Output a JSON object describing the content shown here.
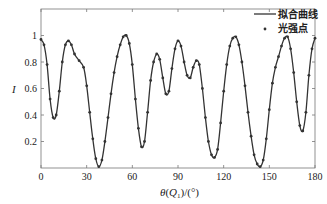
{
  "chart_data": {
    "type": "line",
    "title": "",
    "xlabel": "θ(Q1)/(°)",
    "ylabel": "I",
    "xlim": [
      0,
      180
    ],
    "ylim": [
      0,
      1.2
    ],
    "xticks": [
      0,
      30,
      60,
      90,
      120,
      150,
      180
    ],
    "yticks": [
      0.2,
      0.4,
      0.6,
      0.8,
      1
    ],
    "ytick_labels": [
      "0.2",
      "0.4",
      "0.6",
      "0.8",
      "1"
    ],
    "grid": false,
    "legend_position": "upper right",
    "series": [
      {
        "name": "拟合曲线",
        "style": "solid line",
        "color": "#333333",
        "x": [
          0,
          2,
          4,
          6,
          8,
          10,
          12,
          14,
          16,
          18,
          20,
          22,
          25,
          28,
          30,
          32,
          34,
          36,
          38,
          40,
          42,
          44,
          46,
          48,
          50,
          52,
          54,
          56,
          58,
          60,
          62,
          64,
          66,
          68,
          70,
          72,
          74,
          76,
          78,
          80,
          82,
          84,
          86,
          88,
          90,
          92,
          94,
          96,
          98,
          100,
          102,
          104,
          106,
          108,
          110,
          112,
          114,
          116,
          118,
          120,
          122,
          124,
          126,
          128,
          130,
          132,
          134,
          136,
          138,
          140,
          142,
          144,
          146,
          148,
          150,
          152,
          154,
          156,
          158,
          160,
          162,
          164,
          166,
          168,
          170,
          172,
          174,
          176,
          178,
          180
        ],
        "values": [
          0.97,
          0.93,
          0.78,
          0.52,
          0.38,
          0.4,
          0.58,
          0.8,
          0.93,
          0.96,
          0.93,
          0.86,
          0.81,
          0.76,
          0.62,
          0.42,
          0.22,
          0.07,
          0.01,
          0.06,
          0.2,
          0.38,
          0.56,
          0.72,
          0.84,
          0.93,
          0.99,
          1.0,
          0.94,
          0.78,
          0.52,
          0.3,
          0.16,
          0.2,
          0.42,
          0.66,
          0.8,
          0.86,
          0.82,
          0.68,
          0.56,
          0.58,
          0.75,
          0.9,
          0.96,
          0.92,
          0.8,
          0.7,
          0.68,
          0.76,
          0.81,
          0.78,
          0.6,
          0.38,
          0.2,
          0.1,
          0.08,
          0.14,
          0.34,
          0.58,
          0.78,
          0.92,
          0.98,
          0.99,
          0.93,
          0.8,
          0.62,
          0.42,
          0.24,
          0.1,
          0.03,
          0.01,
          0.06,
          0.22,
          0.44,
          0.64,
          0.76,
          0.84,
          0.92,
          0.98,
          0.99,
          0.9,
          0.72,
          0.5,
          0.32,
          0.28,
          0.42,
          0.7,
          0.9,
          0.98
        ]
      },
      {
        "name": "光强点",
        "style": "markers",
        "color": "#333333"
      }
    ]
  },
  "legend": {
    "items": [
      {
        "label": "拟合曲线",
        "symbol": "line"
      },
      {
        "label": "光强点",
        "symbol": "dot"
      }
    ]
  },
  "axes": {
    "xlabel_parts": {
      "theta": "θ",
      "open": "(",
      "q": "Q",
      "sub": "1",
      "close": ")/(°)"
    },
    "ylabel": "I"
  }
}
